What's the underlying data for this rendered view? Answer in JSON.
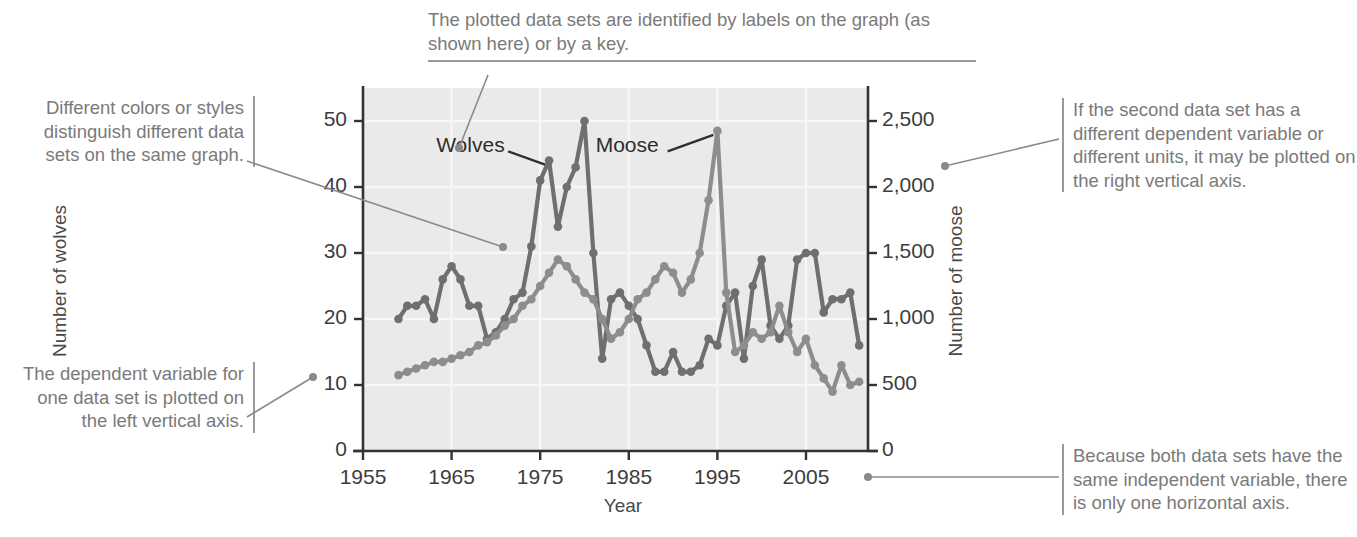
{
  "annotations": {
    "styles": "Different colors or styles distinguish different data sets on the same graph.",
    "left_axis": "The dependent variable for one data set is plotted on the left vertical axis.",
    "labels": "The plotted data sets are identified by labels on the graph (as shown here) or by a key.",
    "right_axis": "If the second data set has a different dependent variable or different units, it may be plotted on the right vertical axis.",
    "horizontal_axis": "Because both data sets have the same independent variable, there is only one horizontal axis."
  },
  "colors": {
    "plot_background": "#eaeaea",
    "gridline": "#f7f7f7",
    "axis": "#333333",
    "annotation_text": "#7a7a7a",
    "annotation_rule": "#9a9a9a",
    "leader_line": "#8a8a8a",
    "wolves": "#6f6f6f",
    "moose": "#8d8d8d"
  },
  "chart_data": {
    "type": "line",
    "title": "",
    "xlabel": "Year",
    "ylabel": "Number of wolves",
    "y2label": "Number of moose",
    "xlim": [
      1955,
      2012
    ],
    "xticks": [
      1955,
      1965,
      1975,
      1985,
      1995,
      2005
    ],
    "xticklabels": [
      "1955",
      "1965",
      "1975",
      "1985",
      "1995",
      "2005"
    ],
    "ylim": [
      0,
      55
    ],
    "yticks": [
      0,
      10,
      20,
      30,
      40,
      50
    ],
    "yticklabels": [
      "0",
      "10",
      "20",
      "30",
      "40",
      "50"
    ],
    "y2lim": [
      0,
      2750
    ],
    "y2ticks": [
      0,
      500,
      1000,
      1500,
      2000,
      2500
    ],
    "y2ticklabels": [
      "0",
      "500",
      "1,000",
      "1,500",
      "2,000",
      "2,500"
    ],
    "grid": true,
    "legend": "labels-on-graph",
    "series": [
      {
        "name": "Wolves",
        "axis": "left",
        "units": "wolves",
        "color": "#6f6f6f",
        "label_position": {
          "x": 1968,
          "y": 46
        },
        "x": [
          1959,
          1960,
          1961,
          1962,
          1963,
          1964,
          1965,
          1966,
          1967,
          1968,
          1969,
          1970,
          1971,
          1972,
          1973,
          1974,
          1975,
          1976,
          1977,
          1978,
          1979,
          1980,
          1981,
          1982,
          1983,
          1984,
          1985,
          1986,
          1987,
          1988,
          1989,
          1990,
          1991,
          1992,
          1993,
          1994,
          1995,
          1996,
          1997,
          1998,
          1999,
          2000,
          2001,
          2002,
          2003,
          2004,
          2005,
          2006,
          2007,
          2008,
          2009,
          2010,
          2011
        ],
        "y": [
          20,
          22,
          22,
          23,
          20,
          26,
          28,
          26,
          22,
          22,
          17,
          18,
          20,
          23,
          24,
          31,
          41,
          44,
          34,
          40,
          43,
          50,
          30,
          14,
          23,
          24,
          22,
          20,
          16,
          12,
          12,
          15,
          12,
          12,
          13,
          17,
          16,
          22,
          24,
          14,
          25,
          29,
          19,
          17,
          19,
          29,
          30,
          30,
          21,
          23,
          23,
          24,
          16
        ]
      },
      {
        "name": "Moose",
        "axis": "right",
        "units": "moose",
        "color": "#8d8d8d",
        "label_position": {
          "x": 1986,
          "y": 46
        },
        "x": [
          1959,
          1960,
          1961,
          1962,
          1963,
          1964,
          1965,
          1966,
          1967,
          1968,
          1969,
          1970,
          1971,
          1972,
          1973,
          1974,
          1975,
          1976,
          1977,
          1978,
          1979,
          1980,
          1981,
          1982,
          1983,
          1984,
          1985,
          1986,
          1987,
          1988,
          1989,
          1990,
          1991,
          1992,
          1993,
          1994,
          1995,
          1996,
          1997,
          1998,
          1999,
          2000,
          2001,
          2002,
          2003,
          2004,
          2005,
          2006,
          2007,
          2008,
          2009,
          2010,
          2011
        ],
        "y_moose": [
          575,
          600,
          625,
          650,
          675,
          675,
          700,
          725,
          750,
          800,
          825,
          875,
          950,
          1000,
          1100,
          1150,
          1250,
          1350,
          1450,
          1400,
          1300,
          1200,
          1150,
          1000,
          850,
          900,
          1000,
          1150,
          1200,
          1300,
          1400,
          1350,
          1200,
          1300,
          1500,
          1900,
          2425,
          1200,
          750,
          800,
          900,
          850,
          900,
          1100,
          900,
          750,
          850,
          650,
          550,
          450,
          650,
          500,
          525
        ]
      }
    ],
    "annotations_on_plot": [
      {
        "text": "Wolves",
        "points_to": "wolves-series"
      },
      {
        "text": "Moose",
        "points_to": "moose-series"
      }
    ]
  }
}
